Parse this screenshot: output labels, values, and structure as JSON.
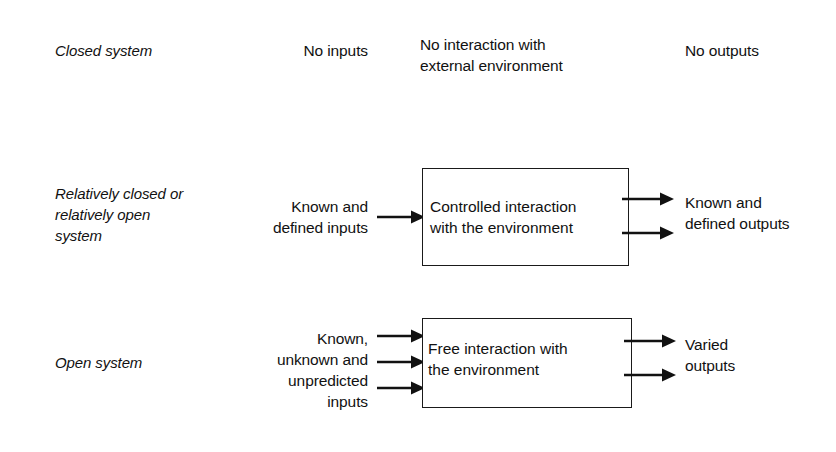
{
  "diagram": {
    "rows": [
      {
        "id": "closed-system",
        "label": "Closed system",
        "input_text": "No inputs",
        "interaction_text": "No interaction with\nexternal environment",
        "output_text": "No outputs",
        "has_box": false,
        "input_arrows": 0,
        "output_arrows": 0
      },
      {
        "id": "relatively-closed-open-system",
        "label": "Relatively closed or\nrelatively open\nsystem",
        "input_text": "Known and\ndefined inputs",
        "interaction_text": "Controlled interaction\nwith the environment",
        "output_text": "Known and\ndefined outputs",
        "has_box": true,
        "input_arrows": 1,
        "output_arrows": 2
      },
      {
        "id": "open-system",
        "label": "Open system",
        "input_text": "Known,\nunknown and\nunpredicted\ninputs",
        "interaction_text": "Free interaction with\nthe environment",
        "output_text": "Varied\noutputs",
        "has_box": true,
        "input_arrows": 3,
        "output_arrows": 2
      }
    ],
    "colors": {
      "background": "#ffffff",
      "ink": "#111111",
      "box_border": "#1a1a1a"
    }
  }
}
